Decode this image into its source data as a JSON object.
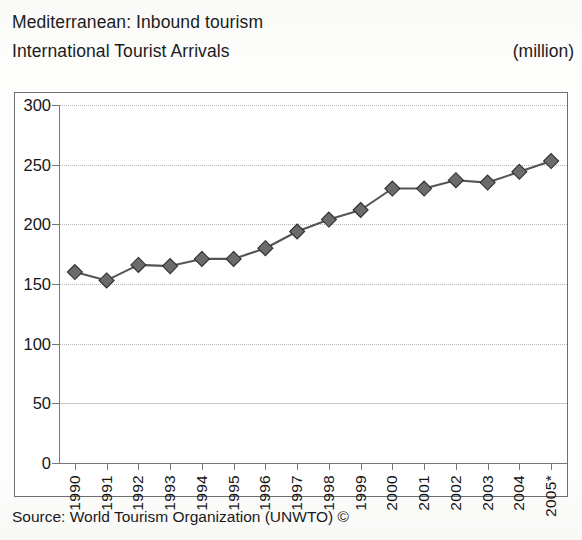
{
  "header": {
    "title_line_1": "Mediterranean: Inbound tourism",
    "title_line_2": "International Tourist Arrivals",
    "unit": "(million)"
  },
  "footer": {
    "source": "Source: World Tourism Organization (UNWTO) ©"
  },
  "chart_data": {
    "type": "line",
    "subtitle": "International Tourist Arrivals",
    "unit": "million",
    "xlabel": "",
    "ylabel": "",
    "ylim": [
      0,
      300
    ],
    "yticks": [
      0,
      50,
      100,
      150,
      200,
      250,
      300
    ],
    "ytick_labels": [
      "0",
      "50",
      "100",
      "150",
      "200",
      "250",
      "300"
    ],
    "grid": true,
    "grid_axis": "y",
    "legend": false,
    "marker": "diamond",
    "line_color": "#555555",
    "marker_color": "#6b6b6b",
    "categories": [
      "1990",
      "1991",
      "1992",
      "1993",
      "1994",
      "1995",
      "1996",
      "1997",
      "1998",
      "1999",
      "2000",
      "2001",
      "2002",
      "2003",
      "2004",
      "2005*"
    ],
    "values": [
      160,
      153,
      166,
      165,
      171,
      171,
      180,
      194,
      204,
      212,
      230,
      230,
      237,
      235,
      244,
      253
    ],
    "series": [
      {
        "name": "International Tourist Arrivals",
        "values": [
          160,
          153,
          166,
          165,
          171,
          171,
          180,
          194,
          204,
          212,
          230,
          230,
          237,
          235,
          244,
          253
        ]
      }
    ],
    "note": "2005* denotes provisional / estimated figure"
  }
}
